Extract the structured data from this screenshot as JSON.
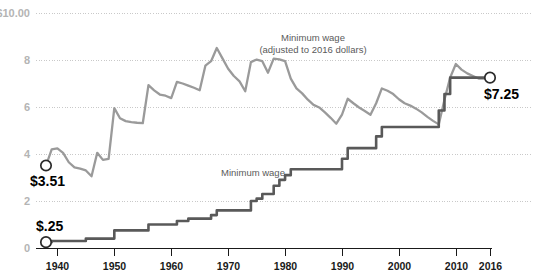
{
  "chart_data": {
    "type": "line",
    "title": "",
    "xlabel": "",
    "ylabel": "",
    "xlim": [
      1938,
      2016
    ],
    "ylim": [
      0,
      10
    ],
    "grid": true,
    "legend_position": "inline-annotations",
    "y_ticks": [
      "$10.00",
      "8",
      "6",
      "4",
      "2",
      "0"
    ],
    "y_tick_values": [
      10,
      8,
      6,
      4,
      2,
      0
    ],
    "x_ticks": [
      "1940",
      "1950",
      "1960",
      "1970",
      "1980",
      "1990",
      "2000",
      "2010",
      "2016"
    ],
    "x_tick_values": [
      1940,
      1950,
      1960,
      1970,
      1980,
      1990,
      2000,
      2010,
      2016
    ],
    "series": [
      {
        "name": "Minimum wage (adjusted to 2016 dollars)",
        "color": "#9a9a9a",
        "annotation_line_1": "Minimum wage",
        "annotation_line_2": "(adjusted to 2016 dollars)",
        "x": [
          1938,
          1939,
          1940,
          1941,
          1942,
          1943,
          1944,
          1945,
          1946,
          1947,
          1948,
          1949,
          1950,
          1951,
          1952,
          1953,
          1954,
          1955,
          1956,
          1957,
          1958,
          1959,
          1960,
          1961,
          1962,
          1963,
          1964,
          1965,
          1966,
          1967,
          1968,
          1969,
          1970,
          1971,
          1972,
          1973,
          1974,
          1975,
          1976,
          1977,
          1978,
          1979,
          1980,
          1981,
          1982,
          1983,
          1984,
          1985,
          1986,
          1987,
          1988,
          1989,
          1990,
          1991,
          1992,
          1993,
          1994,
          1995,
          1996,
          1997,
          1998,
          1999,
          2000,
          2001,
          2002,
          2003,
          2004,
          2005,
          2006,
          2007,
          2008,
          2009,
          2010,
          2011,
          2012,
          2013,
          2014,
          2015,
          2016
        ],
        "y": [
          3.51,
          4.2,
          4.24,
          4.05,
          3.65,
          3.43,
          3.38,
          3.3,
          3.05,
          4.05,
          3.75,
          3.79,
          5.95,
          5.52,
          5.4,
          5.36,
          5.33,
          5.31,
          6.93,
          6.71,
          6.53,
          6.48,
          6.38,
          7.07,
          7.0,
          6.91,
          6.82,
          6.71,
          7.76,
          7.95,
          8.51,
          8.07,
          7.63,
          7.32,
          7.09,
          6.67,
          7.91,
          8.02,
          7.95,
          7.46,
          8.06,
          8.03,
          7.95,
          7.21,
          6.79,
          6.58,
          6.31,
          6.09,
          5.98,
          5.77,
          5.54,
          5.29,
          5.68,
          6.35,
          6.16,
          5.98,
          5.83,
          5.67,
          6.16,
          6.79,
          6.69,
          6.55,
          6.33,
          6.16,
          6.06,
          5.93,
          5.77,
          5.58,
          5.41,
          5.26,
          6.31,
          7.25,
          7.83,
          7.59,
          7.43,
          7.32,
          7.21,
          7.21,
          7.25
        ],
        "start_label": "$3.51",
        "end_label": "$7.25",
        "start_value": 3.51,
        "end_value": 7.25
      },
      {
        "name": "Minimum wage",
        "color": "#595959",
        "annotation_line_1": "Minimum wage",
        "x": [
          1938,
          1939,
          1940,
          1941,
          1942,
          1943,
          1944,
          1945,
          1946,
          1947,
          1948,
          1949,
          1950,
          1951,
          1952,
          1953,
          1954,
          1955,
          1956,
          1957,
          1958,
          1959,
          1960,
          1961,
          1962,
          1963,
          1964,
          1965,
          1966,
          1967,
          1968,
          1969,
          1970,
          1971,
          1972,
          1973,
          1974,
          1975,
          1976,
          1977,
          1978,
          1979,
          1980,
          1981,
          1982,
          1983,
          1984,
          1985,
          1986,
          1987,
          1988,
          1989,
          1990,
          1991,
          1992,
          1993,
          1994,
          1995,
          1996,
          1997,
          1998,
          1999,
          2000,
          2001,
          2002,
          2003,
          2004,
          2005,
          2006,
          2007,
          2008,
          2009,
          2010,
          2011,
          2012,
          2013,
          2014,
          2015,
          2016
        ],
        "y": [
          0.25,
          0.3,
          0.3,
          0.3,
          0.3,
          0.3,
          0.3,
          0.4,
          0.4,
          0.4,
          0.4,
          0.4,
          0.75,
          0.75,
          0.75,
          0.75,
          0.75,
          0.75,
          1.0,
          1.0,
          1.0,
          1.0,
          1.0,
          1.15,
          1.15,
          1.25,
          1.25,
          1.25,
          1.25,
          1.4,
          1.6,
          1.6,
          1.6,
          1.6,
          1.6,
          1.6,
          2.0,
          2.1,
          2.3,
          2.3,
          2.65,
          2.9,
          3.1,
          3.35,
          3.35,
          3.35,
          3.35,
          3.35,
          3.35,
          3.35,
          3.35,
          3.35,
          3.8,
          4.25,
          4.25,
          4.25,
          4.25,
          4.25,
          4.75,
          5.15,
          5.15,
          5.15,
          5.15,
          5.15,
          5.15,
          5.15,
          5.15,
          5.15,
          5.15,
          5.85,
          6.55,
          7.25,
          7.25,
          7.25,
          7.25,
          7.25,
          7.25,
          7.25,
          7.25
        ],
        "start_label": "$.25",
        "end_label": "",
        "start_value": 0.25,
        "end_value": 7.25
      }
    ]
  },
  "colors": {
    "adjusted_line": "#9a9a9a",
    "nominal_line": "#595959",
    "gridline": "#c9c9c9",
    "axis": "#1a1a1a",
    "ytick_text": "#b4b4b4",
    "xtick_text": "#1a1a1a",
    "annotation_text": "#5a5a5a",
    "endpoint_text": "#000000",
    "background": "#ffffff"
  }
}
